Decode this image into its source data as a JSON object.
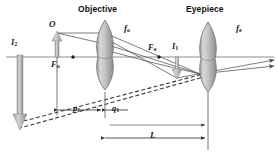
{
  "figure": {
    "kind": "optics-ray-diagram",
    "background": "#ffffff",
    "ink": "#2b2b2b",
    "lens_fill": "#b9b9b9",
    "arrow_fill": "#b5b5b5"
  },
  "labels": {
    "objective": "Objective",
    "eyepiece": "Eyepiece",
    "f_objective": "f",
    "f_objective_sub": "o",
    "f_eyepiece": "f",
    "f_eyepiece_sub": "e",
    "object": "O",
    "focal_point_objective": "F",
    "focal_point_objective_sub": "o",
    "focal_point_eyepiece": "F",
    "focal_point_eyepiece_sub": "e",
    "image_one": "I",
    "image_one_sub": "1",
    "image_two": "I",
    "image_two_sub": "2",
    "distance_p1": "p",
    "distance_p1_sub": "1",
    "distance_q1": "q",
    "distance_q1_sub": "1",
    "tube_length": "L"
  },
  "geometry": {
    "axis_y": 57,
    "objective_x": 105,
    "eyepiece_x": 208,
    "object_x": 57,
    "object_top_y": 33,
    "final_image_x": 20,
    "final_image_bottom_y": 128,
    "intermediate_image_x": 177,
    "intermediate_image_bottom_y": 78,
    "p1_span": [
      57,
      105
    ],
    "q1_span": [
      105,
      177
    ],
    "L_span": [
      105,
      208
    ]
  }
}
